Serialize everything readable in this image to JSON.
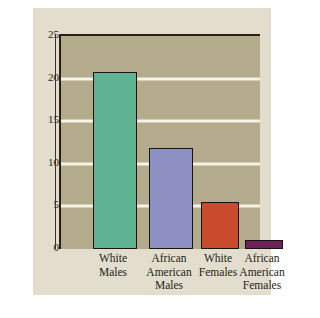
{
  "chart_data": {
    "type": "bar",
    "title": "",
    "subtitle": "",
    "xlabel": "",
    "ylabel": "Suicides per 100,000",
    "ylim": [
      0,
      25
    ],
    "yticks": [
      0,
      5,
      10,
      15,
      20,
      25
    ],
    "ytick_labels": [
      "0",
      "5",
      "10",
      "15",
      "20",
      "25"
    ],
    "grid": true,
    "grid_axis": "y",
    "gridline_values": [
      5,
      10,
      15,
      20
    ],
    "gridline_color": "#f5f2e8",
    "legend": null,
    "legend_position": "none",
    "categories": [
      "White Males",
      "African American Males",
      "White Females",
      "African American Females"
    ],
    "category_lines": [
      [
        "White",
        "Males"
      ],
      [
        "African",
        "American",
        "Males"
      ],
      [
        "White",
        "Females"
      ],
      [
        "African",
        "American",
        "Females"
      ]
    ],
    "values": [
      20.8,
      11.8,
      5.5,
      1.0
    ],
    "bar_colors": [
      "#5fb392",
      "#8e90c4",
      "#c94a2c",
      "#6c2158"
    ],
    "bar_outline_color": "#181410",
    "plot_background": "#b3ab8b",
    "figure_background": "#e2ddcd",
    "page_background": "#ffffff",
    "axis_color": "#2b2113",
    "text_color": "#1d1d19"
  }
}
